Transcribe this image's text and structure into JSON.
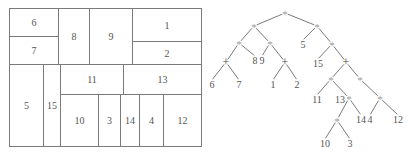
{
  "floorplan": {
    "outer": {
      "x": 9,
      "y": 8,
      "w": 193,
      "h": 139
    },
    "rects": [
      {
        "label": "6",
        "x": 9,
        "y": 8,
        "w": 50,
        "h": 29
      },
      {
        "label": "7",
        "x": 9,
        "y": 36,
        "w": 50,
        "h": 29
      },
      {
        "label": "8",
        "x": 58,
        "y": 8,
        "w": 32,
        "h": 57
      },
      {
        "label": "9",
        "x": 89,
        "y": 8,
        "w": 44,
        "h": 57
      },
      {
        "label": "1",
        "x": 132,
        "y": 8,
        "w": 70,
        "h": 34
      },
      {
        "label": "2",
        "x": 132,
        "y": 41,
        "w": 70,
        "h": 24
      },
      {
        "label": "5",
        "x": 9,
        "y": 64,
        "w": 35,
        "h": 83
      },
      {
        "label": "15",
        "x": 43,
        "y": 64,
        "w": 18,
        "h": 83
      },
      {
        "label": "11",
        "x": 60,
        "y": 64,
        "w": 64,
        "h": 31
      },
      {
        "label": "13",
        "x": 123,
        "y": 64,
        "w": 79,
        "h": 31
      },
      {
        "label": "10",
        "x": 60,
        "y": 94,
        "w": 39,
        "h": 53
      },
      {
        "label": "3",
        "x": 98,
        "y": 94,
        "w": 23,
        "h": 53
      },
      {
        "label": "14",
        "x": 120,
        "y": 94,
        "w": 20,
        "h": 53
      },
      {
        "label": "4",
        "x": 139,
        "y": 94,
        "w": 25,
        "h": 53
      },
      {
        "label": "12",
        "x": 163,
        "y": 94,
        "w": 39,
        "h": 53
      }
    ]
  },
  "tree": {
    "nodes": [
      {
        "id": "n0",
        "label": "*",
        "x": 285,
        "y": 13,
        "kind": "op"
      },
      {
        "id": "n1",
        "label": "*",
        "x": 254,
        "y": 26,
        "kind": "op"
      },
      {
        "id": "n2",
        "label": "*",
        "x": 317,
        "y": 26,
        "kind": "op"
      },
      {
        "id": "n3",
        "label": "*",
        "x": 239,
        "y": 43,
        "kind": "op"
      },
      {
        "id": "n4",
        "label": "*",
        "x": 270,
        "y": 43,
        "kind": "op"
      },
      {
        "id": "n5",
        "label": "+",
        "x": 226,
        "y": 62,
        "kind": "op"
      },
      {
        "id": "n6",
        "label": "8",
        "x": 255,
        "y": 64,
        "kind": "leaf"
      },
      {
        "id": "n7",
        "label": "9",
        "x": 262,
        "y": 64,
        "kind": "leaf"
      },
      {
        "id": "n8",
        "label": "+",
        "x": 285,
        "y": 62,
        "kind": "op"
      },
      {
        "id": "n9",
        "label": "6",
        "x": 212,
        "y": 88,
        "kind": "leaf"
      },
      {
        "id": "n10",
        "label": "7",
        "x": 239,
        "y": 88,
        "kind": "leaf"
      },
      {
        "id": "n11",
        "label": "1",
        "x": 273,
        "y": 88,
        "kind": "leaf"
      },
      {
        "id": "n12",
        "label": "2",
        "x": 297,
        "y": 88,
        "kind": "leaf"
      },
      {
        "id": "n13",
        "label": "5",
        "x": 303,
        "y": 48,
        "kind": "leaf"
      },
      {
        "id": "n14",
        "label": "*",
        "x": 332,
        "y": 44,
        "kind": "op"
      },
      {
        "id": "n15",
        "label": "15",
        "x": 318,
        "y": 67,
        "kind": "leaf"
      },
      {
        "id": "n16",
        "label": "+",
        "x": 346,
        "y": 62,
        "kind": "op"
      },
      {
        "id": "n17",
        "label": "*",
        "x": 331,
        "y": 79,
        "kind": "op"
      },
      {
        "id": "n18",
        "label": "*",
        "x": 360,
        "y": 79,
        "kind": "op"
      },
      {
        "id": "n19",
        "label": "11",
        "x": 317,
        "y": 103,
        "kind": "leaf"
      },
      {
        "id": "n20",
        "label": "*",
        "x": 349,
        "y": 98,
        "kind": "op"
      },
      {
        "id": "n21",
        "label": "*",
        "x": 380,
        "y": 98,
        "kind": "op"
      },
      {
        "id": "n22",
        "label": "*",
        "x": 337,
        "y": 120,
        "kind": "op"
      },
      {
        "id": "n23",
        "label": "14",
        "x": 361,
        "y": 123,
        "kind": "leaf"
      },
      {
        "id": "n24",
        "label": "4",
        "x": 370,
        "y": 123,
        "kind": "leaf"
      },
      {
        "id": "n25",
        "label": "12",
        "x": 398,
        "y": 123,
        "kind": "leaf"
      },
      {
        "id": "n26",
        "label": "10",
        "x": 325,
        "y": 147,
        "kind": "leaf"
      },
      {
        "id": "n27",
        "label": "3",
        "x": 350,
        "y": 147,
        "kind": "leaf"
      }
    ],
    "annotations": [
      {
        "label": "13",
        "x": 340,
        "y": 103
      }
    ],
    "edges": [
      [
        "n0",
        "n1"
      ],
      [
        "n0",
        "n2"
      ],
      [
        "n1",
        "n3"
      ],
      [
        "n1",
        "n4"
      ],
      [
        "n3",
        "n5"
      ],
      [
        "n3",
        "n6"
      ],
      [
        "n4",
        "n7"
      ],
      [
        "n4",
        "n8"
      ],
      [
        "n5",
        "n9"
      ],
      [
        "n5",
        "n10"
      ],
      [
        "n8",
        "n11"
      ],
      [
        "n8",
        "n12"
      ],
      [
        "n2",
        "n13"
      ],
      [
        "n2",
        "n14"
      ],
      [
        "n14",
        "n15"
      ],
      [
        "n14",
        "n16"
      ],
      [
        "n16",
        "n17"
      ],
      [
        "n16",
        "n18"
      ],
      [
        "n17",
        "n19"
      ],
      [
        "n17",
        "n20"
      ],
      [
        "n18",
        "n21"
      ],
      [
        "n20",
        "n22"
      ],
      [
        "n20",
        "n23"
      ],
      [
        "n21",
        "n24"
      ],
      [
        "n21",
        "n25"
      ],
      [
        "n22",
        "n26"
      ],
      [
        "n22",
        "n27"
      ]
    ]
  },
  "colors": {
    "line": "#7a7a7a",
    "star": "#9a9a9a",
    "text": "#555555"
  }
}
